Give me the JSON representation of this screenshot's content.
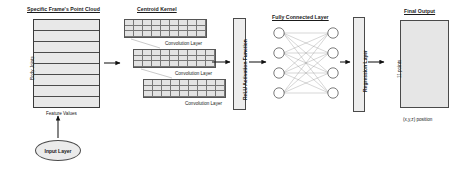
{
  "diagram": {
    "title_point_cloud": "Specific Frame's Point Cloud",
    "title_centroid_kernel": "Centroid Kernel",
    "title_fully_connected": "Fully Connected Layer",
    "title_final_output": "Final Output",
    "axis_body_joints": "Body Joints",
    "axis_feature_values": "Feature Values",
    "conv_layer_1": "Convolution Layer",
    "conv_layer_2": "Convolution Layer",
    "conv_layer_3": "Convolution Layer",
    "relu_label": "ReLU Activation Function",
    "regression_label": "Regression Layer",
    "points_label": "11 points",
    "position_label": "(x,y,z) position",
    "input_layer": "Input Layer"
  },
  "colors": {
    "stroke": "#444444",
    "fill_light": "#e8e8e8",
    "fill_bar": "#ededed",
    "text": "#1a1a1a"
  }
}
